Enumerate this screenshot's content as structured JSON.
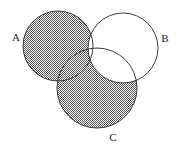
{
  "figure": {
    "kind": "venn-diagram",
    "set_count": 3,
    "background_color": "#ffffff",
    "outline_color": "#3a3a3a",
    "shading_color": "#6b6b6b",
    "shading_pattern": "fine-checkerboard-dither",
    "shaded_region_expression": "(A union C) minus B"
  },
  "sets": {
    "a": {
      "label": "A",
      "label_x": 16,
      "label_y": 38,
      "cx": 58,
      "cy": 46,
      "r": 35,
      "shaded": true
    },
    "b": {
      "label": "B",
      "label_x": 165,
      "label_y": 39,
      "cx": 123,
      "cy": 48,
      "r": 35,
      "shaded": false
    },
    "c": {
      "label": "C",
      "label_x": 113,
      "label_y": 138,
      "cx": 97,
      "cy": 88,
      "r": 40,
      "shaded": true
    }
  }
}
